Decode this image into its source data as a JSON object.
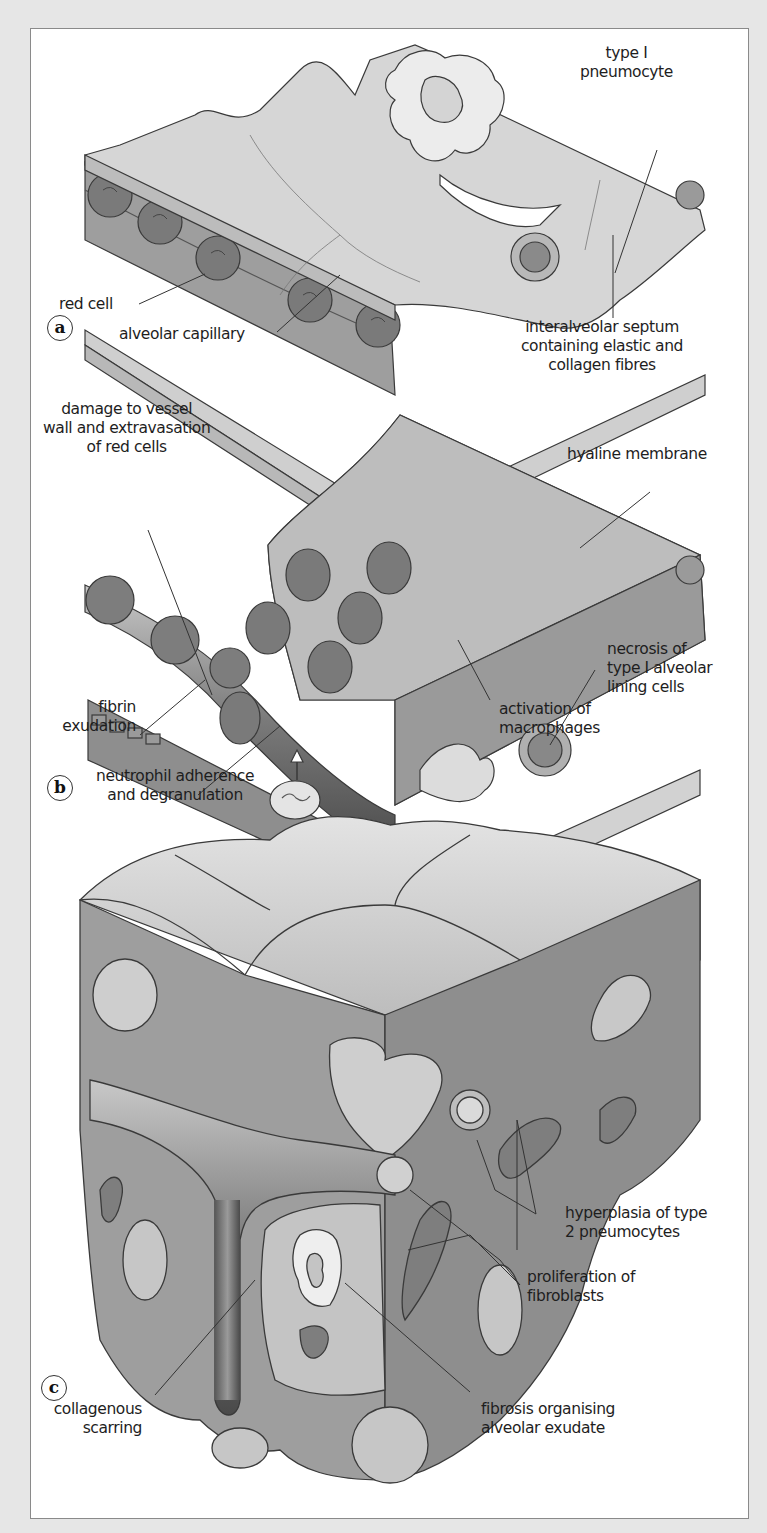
{
  "figure": {
    "panels": [
      {
        "id": "a",
        "letter": "a",
        "description": "Normal alveolar wall",
        "labels": {
          "type1_pneumocyte": "type I\npneumocyte",
          "red_cell": "red cell",
          "alveolar_capillary": "alveolar capillary",
          "interalveolar_septum": "interalveolar septum\ncontaining elastic and\ncollagen fibres"
        }
      },
      {
        "id": "b",
        "letter": "b",
        "description": "Acute exudative phase",
        "labels": {
          "vessel_damage": "damage to vessel\nwall and extravasation\nof red cells",
          "hyaline_membrane": "hyaline membrane",
          "necrosis": "necrosis of\ntype I alveolar\nlining cells",
          "fibrin_exudation": "fibrin\nexudation",
          "macrophages": "activation of\nmacrophages",
          "neutrophil": "neutrophil adherence\nand degranulation"
        }
      },
      {
        "id": "c",
        "letter": "c",
        "description": "Organising / fibrotic phase",
        "labels": {
          "hyperplasia": "hyperplasia of type\n2 pneumocytes",
          "fibroblasts": "proliferation of\nfibroblasts",
          "collagenous_scarring": "collagenous\nscarring",
          "fibrosis": "fibrosis organising\nalveolar exudate"
        }
      }
    ],
    "colors": {
      "frame": "#e6e6e6",
      "panel": "#ffffff",
      "outline": "#3a3a3a",
      "tissue_light": "#d9d9d9",
      "tissue_mid": "#b4b4b4",
      "tissue_dark": "#8e8e8e",
      "red_cell": "#7a7a7a",
      "nucleus": "#cfcfcf"
    }
  }
}
